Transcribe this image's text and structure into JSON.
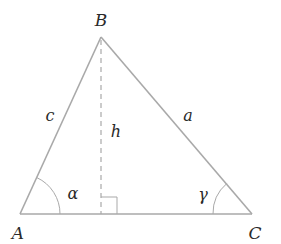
{
  "diagram": {
    "type": "triangle",
    "vertices": {
      "A": {
        "label": "A",
        "x": 20,
        "y": 214
      },
      "B": {
        "label": "B",
        "x": 101,
        "y": 37
      },
      "C": {
        "label": "C",
        "x": 252,
        "y": 214
      }
    },
    "sides": {
      "a": {
        "label": "a",
        "between": "B-C"
      },
      "c": {
        "label": "c",
        "between": "A-B"
      }
    },
    "height": {
      "label": "h",
      "from": "B",
      "to_foot_x": 101
    },
    "angles": {
      "alpha": {
        "label": "α",
        "vertex": "A"
      },
      "gamma": {
        "label": "γ",
        "vertex": "C"
      }
    },
    "colors": {
      "line": "#a9a9a9",
      "text": "#2a2a2a",
      "background": "#ffffff"
    }
  }
}
